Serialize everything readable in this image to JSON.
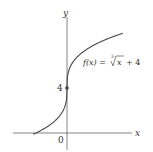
{
  "chart_data": {
    "type": "line",
    "title": "",
    "function_label": "f(x) = ∛x + 4",
    "function_label_parts": {
      "lhs": "f(x) =",
      "root_index": "3",
      "radicand": "x",
      "rhs": "+ 4"
    },
    "xlabel": "x",
    "ylabel": "y",
    "origin_label": "0",
    "y_tick_labels": [
      "4"
    ],
    "marked_points": [
      {
        "x": 0,
        "y": 4
      }
    ],
    "x_intercept": -64,
    "series": [
      {
        "name": "f(x) = cbrt(x) + 4",
        "x": [
          -70,
          -64,
          -27,
          -8,
          -1,
          0,
          1,
          8,
          27,
          64
        ],
        "y": [
          -0.12,
          0,
          1,
          2,
          3,
          4,
          5,
          6,
          7,
          8
        ]
      }
    ],
    "grid": false,
    "legend": "none"
  },
  "colors": {
    "axis": "#555555",
    "curve": "#444444",
    "text": "#333333"
  }
}
